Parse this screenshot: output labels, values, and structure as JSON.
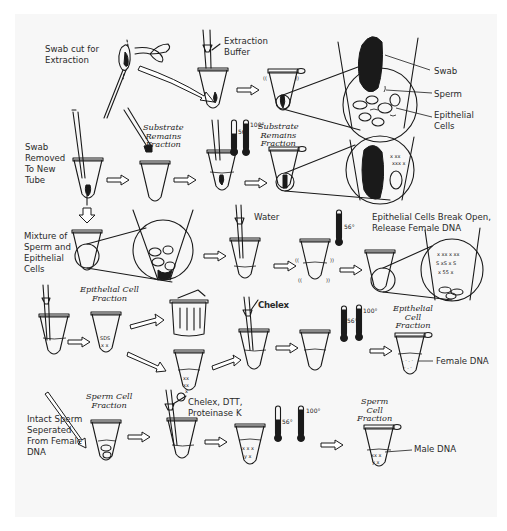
{
  "diagram": {
    "type": "process-flow",
    "rows": [
      {
        "id": "row1",
        "labels": {
          "swab_cut": "Swab cut for\nExtraction",
          "extraction_buffer": "Extraction\nBuffer",
          "swab": "Swab",
          "sperm": "Sperm",
          "epithelial_cells": "Epithelial\nCells"
        }
      },
      {
        "id": "row2",
        "labels": {
          "swab_removed": "Swab\nRemoved\nTo New\nTube",
          "substrate_remains_1": "Substrate\nRemains\nFraction",
          "temp_56": "56°",
          "temp_100": "100°",
          "substrate_remains_2": "Substrate\nRemains\nFraction"
        }
      },
      {
        "id": "row3",
        "labels": {
          "mixture": "Mixture of\nSperm and\nEpithelial\nCells",
          "water": "Water",
          "temp_56": "56°",
          "epithelial_break": "Epithelial Cells Break Open,\nRelease Female DNA"
        }
      },
      {
        "id": "row4",
        "labels": {
          "epithelial_fraction_1": "Epithelial Cell\nFraction",
          "chelex": "Chelex",
          "temp_56": "56°",
          "temp_100": "100°",
          "epithelial_fraction_2": "Epithelial\nCell\nFraction",
          "female_dna": "Female DNA"
        }
      },
      {
        "id": "row5",
        "labels": {
          "sperm_fraction_1": "Sperm Cell\nFraction",
          "intact_sperm": "Intact Sperm\nSeperated\nFrom Female\nDNA",
          "reagents": "Chelex, DTT,\nProteinase K",
          "temp_56": "56°",
          "temp_100": "100°",
          "sperm_fraction_2": "Sperm\nCell\nFraction",
          "male_dna": "Male DNA"
        }
      }
    ],
    "icons": [
      "swab-icon",
      "scissors-icon",
      "pipette-icon",
      "tube-icon",
      "magnified-circle-icon",
      "thermometer-icon",
      "trash-can-icon",
      "arrow-icon"
    ]
  }
}
